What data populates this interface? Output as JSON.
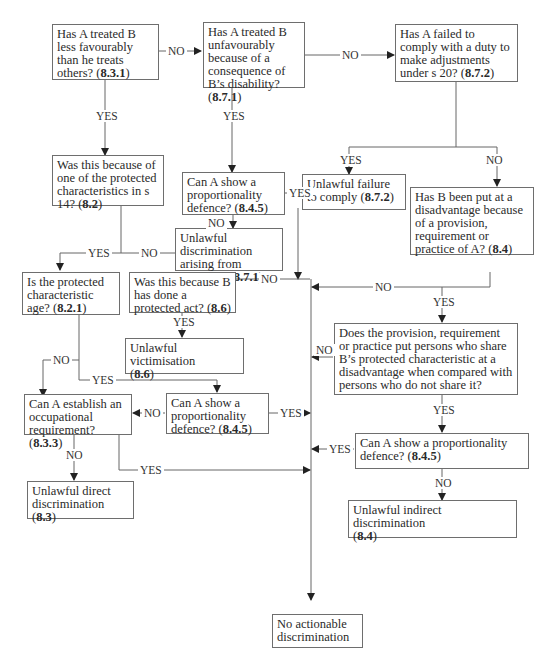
{
  "diagram": {
    "type": "flowchart",
    "nodes": {
      "n1": {
        "text": "Has A treated B less favourably than he treats others?",
        "ref": "8.3.1"
      },
      "n2": {
        "text": "Has A treated B unfavourably because of a consequence of B’s disability?",
        "ref": "8.7.1"
      },
      "n3": {
        "text": "Has A failed to comply with a duty to make adjustments under s 20?",
        "ref": "8.7.2"
      },
      "n4": {
        "text": "Was this because of one of the protected characteristics in s 14?",
        "ref": "8.2"
      },
      "n5": {
        "text": "Can A show a proportionality defence?",
        "ref": "8.4.5"
      },
      "n6": {
        "text": "Unlawful discrimination arising from disability",
        "ref": "8.7.1"
      },
      "n7": {
        "text": "Unlawful failure to comply",
        "ref": "8.7.2"
      },
      "n8": {
        "text": "Has B been put at a disadvantage because of a provision, requirement or practice of A?",
        "ref": "8.4"
      },
      "n9": {
        "text": "Is the protected characteristic age?",
        "ref": "8.2.1"
      },
      "n10": {
        "text": "Was this because B has done a protected act?",
        "ref": "8.6"
      },
      "n11": {
        "text": "Unlawful victimisation",
        "ref": "8.6"
      },
      "n12": {
        "text": "Does the provision, requirement or practice put persons who share B’s protected characteristic at a disadvantage when compared with persons who do not share it?",
        "ref": ""
      },
      "n13": {
        "text": "Can A establish an occupational requirement?",
        "ref": "8.3.3"
      },
      "n14": {
        "text": "Can A show a proportionality defence?",
        "ref": "8.4.5"
      },
      "n15": {
        "text": "Can A show a proportionality defence?",
        "ref": "8.4.5"
      },
      "n16": {
        "text": "Unlawful direct discrimination",
        "ref": "8.3"
      },
      "n17": {
        "text": "Unlawful indirect discrimination",
        "ref": "8.4"
      },
      "n18": {
        "text": "No actionable discrimination",
        "ref": ""
      }
    },
    "labels": {
      "yes": "YES",
      "no": "NO"
    },
    "edges": [
      {
        "from": "n1",
        "to": "n2",
        "label": "NO"
      },
      {
        "from": "n1",
        "to": "n4",
        "label": "YES"
      },
      {
        "from": "n2",
        "to": "n3",
        "label": "NO"
      },
      {
        "from": "n2",
        "to": "n5",
        "label": "YES"
      },
      {
        "from": "n5",
        "to": "n6",
        "label": "NO"
      },
      {
        "from": "n5",
        "to": "n18",
        "label": "YES"
      },
      {
        "from": "n3",
        "to": "n7",
        "label": "YES"
      },
      {
        "from": "n3",
        "to": "n8",
        "label": "NO"
      },
      {
        "from": "n4",
        "to": "n9",
        "label": "YES"
      },
      {
        "from": "n4",
        "to": "n10",
        "label": "NO"
      },
      {
        "from": "n10",
        "to": "n11",
        "label": "YES"
      },
      {
        "from": "n10",
        "to": "n18",
        "label": "NO"
      },
      {
        "from": "n8",
        "to": "n18",
        "label": "NO"
      },
      {
        "from": "n8",
        "to": "n12",
        "label": "YES"
      },
      {
        "from": "n12",
        "to": "n18",
        "label": "NO"
      },
      {
        "from": "n12",
        "to": "n15",
        "label": "YES"
      },
      {
        "from": "n9",
        "to": "n13",
        "label": "NO"
      },
      {
        "from": "n9",
        "to": "n14",
        "label": "YES"
      },
      {
        "from": "n14",
        "to": "n13",
        "label": "NO"
      },
      {
        "from": "n14",
        "to": "n18",
        "label": "YES"
      },
      {
        "from": "n13",
        "to": "n16",
        "label": "NO"
      },
      {
        "from": "n13",
        "to": "n18",
        "label": "YES"
      },
      {
        "from": "n15",
        "to": "n18",
        "label": "YES"
      },
      {
        "from": "n15",
        "to": "n17",
        "label": "NO"
      }
    ]
  }
}
